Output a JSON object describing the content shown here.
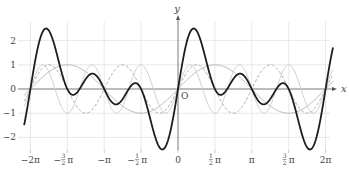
{
  "chart_data": {
    "type": "line",
    "title": "",
    "xlabel": "x",
    "ylabel": "y",
    "origin_label": "O",
    "xlim": [
      -6.5,
      6.7
    ],
    "ylim": [
      -2.6,
      3.0
    ],
    "grid": true,
    "legend": "none",
    "x_ticks": [
      {
        "value": -6.2832,
        "label": "−2π"
      },
      {
        "value": -4.7124,
        "label": "−3/2π"
      },
      {
        "value": -3.1416,
        "label": "−π"
      },
      {
        "value": -1.5708,
        "label": "−1/2π"
      },
      {
        "value": 0,
        "label": "0"
      },
      {
        "value": 1.5708,
        "label": "1/2π"
      },
      {
        "value": 3.1416,
        "label": "π"
      },
      {
        "value": 4.7124,
        "label": "3/2π"
      },
      {
        "value": 6.2832,
        "label": "2π"
      }
    ],
    "y_ticks": [
      {
        "value": 2,
        "label": "2"
      },
      {
        "value": 1,
        "label": "1"
      },
      {
        "value": 0,
        "label": "0"
      },
      {
        "value": -1,
        "label": "−1"
      },
      {
        "value": -2,
        "label": "−2"
      }
    ],
    "series": [
      {
        "name": "sin x",
        "expr": "sin(x)",
        "color": "#b4b4b4",
        "width": 1,
        "dash": ""
      },
      {
        "name": "sin 2x",
        "expr": "sin(2x)",
        "color": "#a8a8a8",
        "width": 1,
        "dash": "3,2"
      },
      {
        "name": "sin 3x",
        "expr": "sin(3x)",
        "color": "#cfcfcf",
        "width": 1,
        "dash": ""
      },
      {
        "name": "sin x + sin 2x + sin 3x",
        "expr": "sin(x)+sin(2x)+sin(3x)",
        "color": "#1e1e1e",
        "width": 1.8,
        "dash": ""
      }
    ],
    "x_range_plotted": [
      -6.55,
      6.6
    ],
    "key_points": [
      {
        "x": 0.6,
        "y": 2.48,
        "note": "max of sum"
      },
      {
        "x": -0.6,
        "y": -2.48,
        "note": "min of sum"
      },
      {
        "x": 1.83,
        "y": -0.22,
        "note": "local min of sum"
      },
      {
        "x": 2.7,
        "y": 0.62,
        "note": "local max of sum"
      }
    ]
  },
  "layout": {
    "origin_px": [
      178,
      89
    ],
    "px_per_rad": 23.49,
    "px_per_unit": 24.2,
    "grid_color": "#e2e2e2",
    "axis_color": "#555555"
  }
}
